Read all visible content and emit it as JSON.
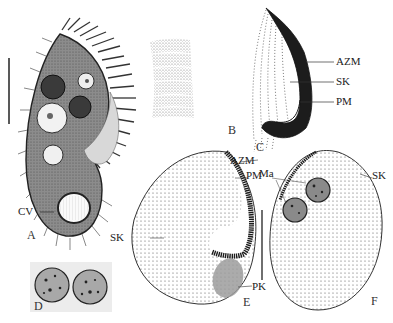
{
  "figure": {
    "panels": [
      {
        "id": "A",
        "label": "A",
        "description": "whole cell, live, ventral view"
      },
      {
        "id": "B",
        "label": "B",
        "description": "cortical granules / striation detail"
      },
      {
        "id": "C",
        "label": "C",
        "description": "oral apparatus detail"
      },
      {
        "id": "D",
        "label": "D",
        "description": "two macronuclear nodules"
      },
      {
        "id": "E",
        "label": "E",
        "description": "ciliature, ventral view (silver stained)"
      },
      {
        "id": "F",
        "label": "F",
        "description": "ciliature, dorsal view (silver stained)"
      }
    ],
    "annotations": {
      "cv": "CV",
      "azm_c": "AZM",
      "sk_c": "SK",
      "pm_c": "PM",
      "azm_e": "AZM",
      "pm_e": "PM",
      "sk_e": "SK",
      "pk_e": "PK",
      "ma_f": "Ma",
      "sk_f": "SK"
    },
    "scale_bar": {
      "present": true
    }
  },
  "colors": {
    "ink": "#222222",
    "cell_fill": "#8a8a8a",
    "pk_fill": "#9c9c9c",
    "paper": "#ffffff"
  }
}
